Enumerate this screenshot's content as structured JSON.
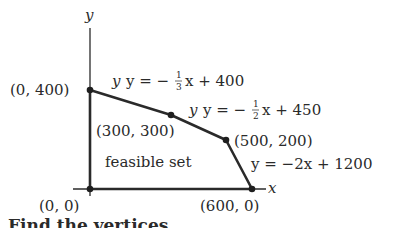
{
  "diagram": {
    "axes": {
      "x_label": "x",
      "y_label": "y"
    },
    "vertices": [
      {
        "label": "(0, 400)",
        "x": 0,
        "y": 400
      },
      {
        "label": "(300, 300)",
        "x": 300,
        "y": 300
      },
      {
        "label": "(500, 200)",
        "x": 500,
        "y": 200
      },
      {
        "label": "(600, 0)",
        "x": 600,
        "y": 0
      },
      {
        "label": "(0, 0)",
        "x": 0,
        "y": 0
      }
    ],
    "constraints": [
      {
        "lhs": "y = −",
        "num": "1",
        "den": "3",
        "rhs": "x + 400"
      },
      {
        "lhs": "y = −",
        "num": "1",
        "den": "2",
        "rhs": "x + 450"
      },
      {
        "text": "y = −2x + 1200"
      }
    ],
    "region_label": "feasible set",
    "caption": "Find the vertices"
  }
}
